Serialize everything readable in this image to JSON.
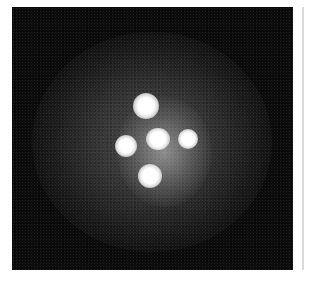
{
  "image": {
    "subject": "quadruply lensed quasar (cross-shaped pattern of four bright spots around a central galaxy core)",
    "background_color": "#0c0c0c",
    "spots": [
      {
        "name": "top",
        "cx": 145,
        "cy": 105,
        "r": 12
      },
      {
        "name": "left",
        "cx": 125,
        "cy": 147,
        "r": 11
      },
      {
        "name": "center",
        "cx": 157,
        "cy": 139,
        "r": 11
      },
      {
        "name": "right",
        "cx": 188,
        "cy": 139,
        "r": 10
      },
      {
        "name": "bottom",
        "cx": 150,
        "cy": 176,
        "r": 12
      }
    ]
  }
}
